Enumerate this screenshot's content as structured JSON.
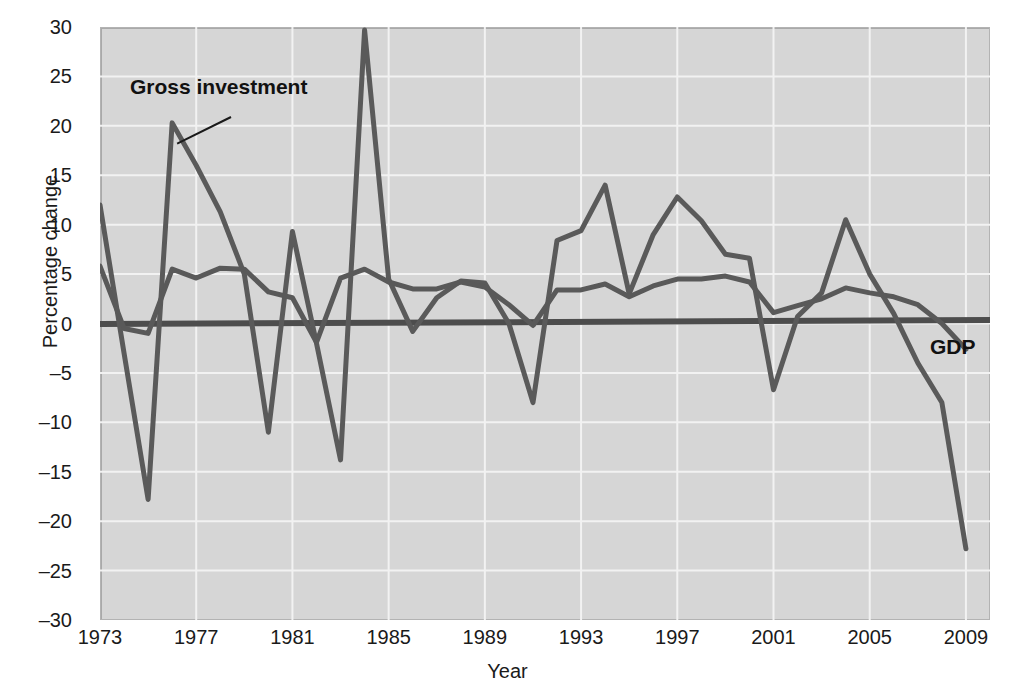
{
  "chart_data": {
    "type": "line",
    "title": "",
    "subtitle": "",
    "xlabel": "Year",
    "ylabel": "Percentage change",
    "xlim": [
      1973,
      2010
    ],
    "ylim": [
      -30,
      30
    ],
    "xticks": [
      "1973",
      "1977",
      "1981",
      "1985",
      "1989",
      "1993",
      "1997",
      "2001",
      "2005",
      "2009"
    ],
    "xtick_values": [
      1973,
      1977,
      1981,
      1985,
      1989,
      1993,
      1997,
      2001,
      2005,
      2009
    ],
    "yticks": [
      "30",
      "25",
      "20",
      "15",
      "10",
      "5",
      "0",
      "–5",
      "–10",
      "–15",
      "–20",
      "–25",
      "–30"
    ],
    "ytick_values": [
      30,
      25,
      20,
      15,
      10,
      5,
      0,
      -5,
      -10,
      -15,
      -20,
      -25,
      -30
    ],
    "grid": true,
    "grid_color": "#f2f2f2",
    "plot_background": "#d6d6d6",
    "legend_position": "inline-annotation",
    "zero_line": true,
    "zero_line_color": "#4d4d4d",
    "x": [
      1973,
      1974,
      1975,
      1976,
      1977,
      1978,
      1979,
      1980,
      1981,
      1982,
      1983,
      1984,
      1985,
      1986,
      1987,
      1988,
      1989,
      1990,
      1991,
      1992,
      1993,
      1994,
      1995,
      1996,
      1997,
      1998,
      1999,
      2000,
      2001,
      2002,
      2003,
      2004,
      2005,
      2006,
      2007,
      2008,
      2009
    ],
    "series": [
      {
        "name": "Gross investment",
        "color": "#5a5a5a",
        "annotation": "Gross investment",
        "values": [
          12.0,
          -3.0,
          -17.8,
          20.3,
          16.0,
          11.3,
          5.0,
          -11.0,
          9.3,
          -2.0,
          -13.8,
          29.7,
          4.5,
          -0.8,
          2.6,
          4.3,
          4.1,
          0.0,
          -8.0,
          8.4,
          9.4,
          14.0,
          3.0,
          9.0,
          12.8,
          10.4,
          7.0,
          6.6,
          -6.7,
          0.7,
          3.1,
          10.5,
          5.0,
          1.0,
          -4.0,
          -8.0,
          -22.8
        ]
      },
      {
        "name": "GDP",
        "color": "#595959",
        "annotation": "GDP",
        "values": [
          5.8,
          -0.5,
          -1.0,
          5.5,
          4.6,
          5.6,
          5.5,
          3.2,
          2.6,
          -1.9,
          4.6,
          5.5,
          4.2,
          3.5,
          3.5,
          4.2,
          3.7,
          1.9,
          -0.2,
          3.4,
          3.4,
          4.0,
          2.7,
          3.8,
          4.5,
          4.5,
          4.8,
          4.2,
          1.1,
          1.8,
          2.5,
          3.6,
          3.1,
          2.7,
          1.9,
          0.0,
          -2.6
        ]
      }
    ]
  }
}
